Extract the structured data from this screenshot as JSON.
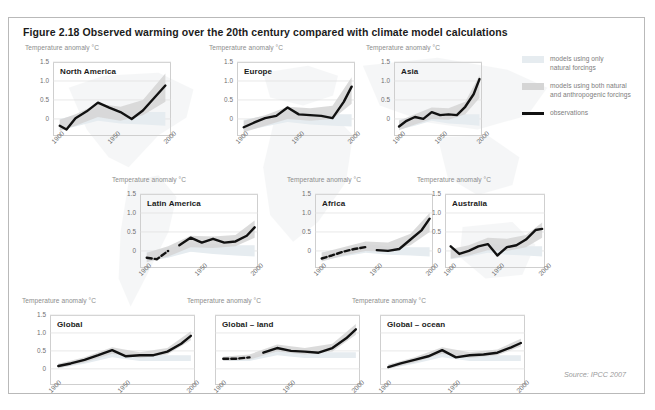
{
  "figure": {
    "title": "Figure 2.18 Observed warming over the 20th century compared with climate model calculations",
    "source": "Source: IPCC 2007",
    "axis_caption": "Temperature anomaly °C",
    "colors": {
      "observations": "#111111",
      "natural_band": "#e6ecf0",
      "both_band": "#d5d5d5",
      "frame": "#b9b9b9",
      "gridline": "#dedede",
      "tick_text": "#6f6f6f",
      "caption_text": "#8d8d8d"
    }
  },
  "legend": {
    "items": [
      {
        "label_line1": "models using only",
        "label_line2": "natural forcings",
        "swatch": "natural-band-swatch"
      },
      {
        "label_line1": "models using both natural",
        "label_line2": "and anthropogenic forcings",
        "swatch": "both-band-swatch"
      },
      {
        "label_line1": "observations",
        "label_line2": "",
        "swatch": "observation-line-swatch"
      }
    ]
  },
  "chart_data": {
    "type": "line",
    "title": "Observed warming over the 20th century compared with climate model calculations",
    "xlabel": "",
    "ylabel": "Temperature anomaly °C",
    "xlim": [
      1900,
      2005
    ],
    "ylim": [
      -0.45,
      1.5
    ],
    "yticks": [
      "1.5",
      "1.0",
      "0.5",
      "0"
    ],
    "ytick_values": [
      1.5,
      1.0,
      0.5,
      0
    ],
    "xticks": [
      "1900",
      "1950",
      "2000"
    ],
    "xtick_values": [
      1900,
      1950,
      2000
    ],
    "grid": true,
    "legend_position": "top-right",
    "series_names": [
      "observations",
      "models using both natural and anthropogenic forcings",
      "models using only natural forcings"
    ],
    "panels": [
      {
        "name": "North America",
        "row": 1,
        "observations": {
          "x": [
            1906,
            1912,
            1920,
            1930,
            1940,
            1950,
            1960,
            1970,
            1980,
            1990,
            2000
          ],
          "y": [
            -0.18,
            -0.28,
            0.02,
            0.2,
            0.43,
            0.3,
            0.18,
            0.0,
            0.22,
            0.55,
            0.88
          ],
          "dashed_before": null
        },
        "both_band": {
          "x": [
            1906,
            1920,
            1940,
            1960,
            1980,
            2000
          ],
          "low": [
            -0.32,
            -0.18,
            0.05,
            -0.05,
            0.1,
            0.45
          ],
          "high": [
            -0.02,
            0.12,
            0.4,
            0.32,
            0.5,
            1.2
          ]
        },
        "natural_band": {
          "x": [
            1906,
            1920,
            1940,
            1960,
            1980,
            2000
          ],
          "low": [
            -0.3,
            -0.2,
            -0.05,
            -0.12,
            -0.15,
            -0.18
          ],
          "high": [
            0.0,
            0.1,
            0.28,
            0.2,
            0.18,
            0.18
          ]
        }
      },
      {
        "name": "Europe",
        "row": 1,
        "observations": {
          "x": [
            1906,
            1915,
            1925,
            1935,
            1945,
            1955,
            1965,
            1975,
            1985,
            1995,
            2002
          ],
          "y": [
            -0.22,
            -0.1,
            0.02,
            0.08,
            0.3,
            0.12,
            0.1,
            0.08,
            0.02,
            0.45,
            0.85
          ],
          "dashed_before": null
        },
        "both_band": {
          "x": [
            1906,
            1925,
            1945,
            1965,
            1985,
            2002
          ],
          "low": [
            -0.35,
            -0.18,
            0.0,
            -0.05,
            0.0,
            0.4
          ],
          "high": [
            -0.05,
            0.1,
            0.32,
            0.28,
            0.35,
            1.1
          ]
        },
        "natural_band": {
          "x": [
            1906,
            1925,
            1945,
            1965,
            1985,
            2002
          ],
          "low": [
            -0.32,
            -0.2,
            -0.08,
            -0.15,
            -0.18,
            -0.2
          ],
          "high": [
            -0.02,
            0.08,
            0.22,
            0.15,
            0.12,
            0.12
          ]
        }
      },
      {
        "name": "Asia",
        "row": 1,
        "observations": {
          "x": [
            1906,
            1915,
            1925,
            1935,
            1945,
            1955,
            1965,
            1975,
            1985,
            1995,
            2002
          ],
          "y": [
            -0.2,
            -0.05,
            0.05,
            0.0,
            0.18,
            0.1,
            0.12,
            0.1,
            0.32,
            0.65,
            1.05
          ],
          "dashed_before": null
        },
        "both_band": {
          "x": [
            1906,
            1925,
            1945,
            1965,
            1985,
            2002
          ],
          "low": [
            -0.3,
            -0.15,
            0.0,
            -0.02,
            0.12,
            0.55
          ],
          "high": [
            -0.05,
            0.12,
            0.3,
            0.28,
            0.45,
            1.15
          ]
        },
        "natural_band": {
          "x": [
            1906,
            1925,
            1945,
            1965,
            1985,
            2002
          ],
          "low": [
            -0.28,
            -0.18,
            -0.05,
            -0.12,
            -0.15,
            -0.18
          ],
          "high": [
            -0.02,
            0.08,
            0.2,
            0.15,
            0.12,
            0.12
          ]
        }
      },
      {
        "name": "Latin America",
        "row": 2,
        "observations": {
          "x": [
            1906,
            1915,
            1925,
            1935,
            1945,
            1955,
            1965,
            1975,
            1985,
            1995,
            2002
          ],
          "y": [
            -0.18,
            -0.22,
            0.0,
            0.15,
            0.35,
            0.22,
            0.32,
            0.22,
            0.25,
            0.4,
            0.62
          ],
          "dashed_before": 1928
        },
        "both_band": {
          "x": [
            1906,
            1925,
            1945,
            1965,
            1985,
            2002
          ],
          "low": [
            -0.3,
            -0.15,
            0.1,
            0.08,
            0.12,
            0.35
          ],
          "high": [
            -0.05,
            0.12,
            0.4,
            0.38,
            0.42,
            0.8
          ]
        },
        "natural_band": {
          "x": [
            1906,
            1925,
            1945,
            1965,
            1985,
            2002
          ],
          "low": [
            -0.28,
            -0.18,
            -0.02,
            -0.08,
            -0.12,
            -0.15
          ],
          "high": [
            -0.02,
            0.08,
            0.22,
            0.18,
            0.15,
            0.15
          ]
        }
      },
      {
        "name": "Africa",
        "row": 2,
        "observations": {
          "x": [
            1906,
            1915,
            1925,
            1935,
            1945,
            1955,
            1965,
            1975,
            1985,
            1995,
            2002
          ],
          "y": [
            -0.2,
            -0.12,
            -0.02,
            0.05,
            0.1,
            0.02,
            0.0,
            0.05,
            0.3,
            0.55,
            0.85
          ],
          "dashed_before": 1952
        },
        "both_band": {
          "x": [
            1906,
            1925,
            1945,
            1965,
            1985,
            2002
          ],
          "low": [
            -0.28,
            -0.12,
            0.0,
            -0.02,
            0.15,
            0.5
          ],
          "high": [
            -0.05,
            0.1,
            0.25,
            0.22,
            0.45,
            1.0
          ]
        },
        "natural_band": {
          "x": [
            1906,
            1925,
            1945,
            1965,
            1985,
            2002
          ],
          "low": [
            -0.26,
            -0.15,
            -0.05,
            -0.1,
            -0.12,
            -0.15
          ],
          "high": [
            -0.03,
            0.06,
            0.18,
            0.12,
            0.1,
            0.1
          ]
        }
      },
      {
        "name": "Australia",
        "row": 2,
        "observations": {
          "x": [
            1906,
            1915,
            1925,
            1935,
            1945,
            1955,
            1965,
            1975,
            1985,
            1995,
            2002
          ],
          "y": [
            0.12,
            -0.08,
            0.0,
            0.12,
            0.18,
            -0.12,
            0.1,
            0.15,
            0.3,
            0.55,
            0.58
          ],
          "dashed_before": null
        },
        "both_band": {
          "x": [
            1906,
            1925,
            1945,
            1965,
            1985,
            2002
          ],
          "low": [
            -0.2,
            -0.12,
            0.02,
            0.0,
            0.1,
            0.35
          ],
          "high": [
            0.05,
            0.15,
            0.35,
            0.32,
            0.42,
            0.75
          ]
        },
        "natural_band": {
          "x": [
            1906,
            1925,
            1945,
            1965,
            1985,
            2002
          ],
          "low": [
            -0.22,
            -0.15,
            -0.05,
            -0.1,
            -0.12,
            -0.15
          ],
          "high": [
            0.02,
            0.1,
            0.2,
            0.15,
            0.12,
            0.12
          ]
        }
      },
      {
        "name": "Global",
        "row": 3,
        "observations": {
          "x": [
            1906,
            1915,
            1925,
            1935,
            1945,
            1955,
            1965,
            1975,
            1985,
            1995,
            2002
          ],
          "y": [
            0.08,
            0.15,
            0.25,
            0.38,
            0.52,
            0.35,
            0.38,
            0.38,
            0.48,
            0.7,
            0.92
          ],
          "dashed_before": null
        },
        "both_band": {
          "x": [
            1906,
            1925,
            1945,
            1965,
            1985,
            2002
          ],
          "low": [
            0.02,
            0.18,
            0.42,
            0.3,
            0.4,
            0.8
          ],
          "high": [
            0.14,
            0.32,
            0.6,
            0.46,
            0.58,
            1.05
          ]
        },
        "natural_band": {
          "x": [
            1906,
            1925,
            1945,
            1965,
            1985,
            2002
          ],
          "low": [
            0.02,
            0.14,
            0.32,
            0.22,
            0.22,
            0.22
          ],
          "high": [
            0.14,
            0.28,
            0.5,
            0.4,
            0.38,
            0.38
          ]
        }
      },
      {
        "name": "Global – land",
        "row": 3,
        "observations": {
          "x": [
            1906,
            1915,
            1925,
            1935,
            1945,
            1955,
            1965,
            1975,
            1985,
            1995,
            2002
          ],
          "y": [
            0.28,
            0.28,
            0.32,
            0.45,
            0.58,
            0.5,
            0.48,
            0.45,
            0.58,
            0.85,
            1.1
          ],
          "dashed_before": 1930
        },
        "both_band": {
          "x": [
            1906,
            1925,
            1945,
            1965,
            1985,
            2002
          ],
          "low": [
            0.22,
            0.26,
            0.48,
            0.4,
            0.48,
            0.95
          ],
          "high": [
            0.34,
            0.4,
            0.68,
            0.58,
            0.7,
            1.25
          ]
        },
        "natural_band": {
          "x": [
            1906,
            1925,
            1945,
            1965,
            1985,
            2002
          ],
          "low": [
            0.22,
            0.22,
            0.38,
            0.3,
            0.3,
            0.3
          ],
          "high": [
            0.34,
            0.36,
            0.56,
            0.48,
            0.46,
            0.46
          ]
        }
      },
      {
        "name": "Global – ocean",
        "row": 3,
        "observations": {
          "x": [
            1906,
            1915,
            1925,
            1935,
            1945,
            1955,
            1965,
            1975,
            1985,
            1995,
            2002
          ],
          "y": [
            0.05,
            0.15,
            0.25,
            0.35,
            0.52,
            0.32,
            0.38,
            0.4,
            0.45,
            0.6,
            0.72
          ],
          "dashed_before": null
        },
        "both_band": {
          "x": [
            1906,
            1925,
            1945,
            1965,
            1985,
            2002
          ],
          "low": [
            0.0,
            0.18,
            0.42,
            0.3,
            0.38,
            0.62
          ],
          "high": [
            0.12,
            0.32,
            0.6,
            0.46,
            0.54,
            0.84
          ]
        },
        "natural_band": {
          "x": [
            1906,
            1925,
            1945,
            1965,
            1985,
            2002
          ],
          "low": [
            0.0,
            0.14,
            0.32,
            0.22,
            0.22,
            0.22
          ],
          "high": [
            0.12,
            0.28,
            0.5,
            0.4,
            0.38,
            0.38
          ]
        }
      }
    ]
  }
}
